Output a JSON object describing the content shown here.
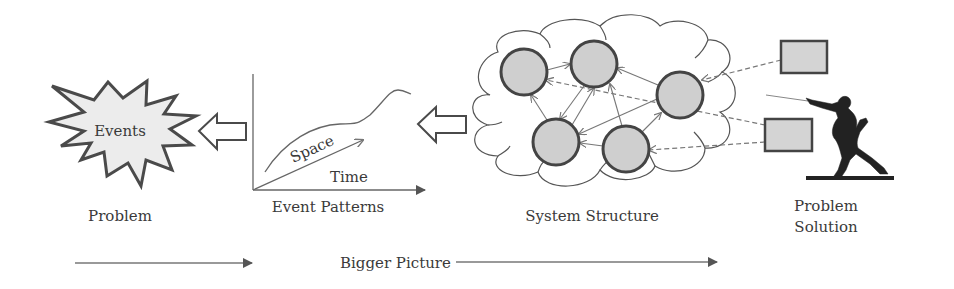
{
  "labels": {
    "events": "Events",
    "problem": "Problem",
    "space": "Space",
    "time": "Time",
    "event_patterns": "Event Patterns",
    "system_structure": "System Structure",
    "problem_solution_line1": "Problem",
    "problem_solution_line2": "Solution",
    "bigger_picture": "Bigger Picture"
  },
  "colors": {
    "stroke": "#4a4a4a",
    "node_fill": "#cfcfcf",
    "starburst_fill": "#ececec",
    "light_line": "#777777"
  }
}
